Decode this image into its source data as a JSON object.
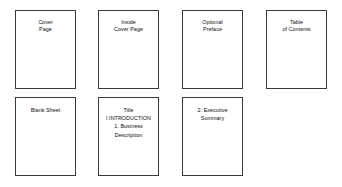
{
  "diagram": {
    "type": "document-structure-sequence",
    "pages": [
      {
        "id": "cover-page",
        "text": "Cover\nPage"
      },
      {
        "id": "inside-cover-page",
        "text": "Inside\nCover Page"
      },
      {
        "id": "optional-preface",
        "text": "Optional\nPreface"
      },
      {
        "id": "table-of-contents",
        "text": "Table\nof Contents"
      },
      {
        "id": "blank-sheet",
        "text": "Blank Sheet"
      },
      {
        "id": "title-introduction",
        "text": "Title\nI.INTRODUCTION\n1. Business\nDescription"
      },
      {
        "id": "executive-summary",
        "text": "2. Executive\nSummary"
      }
    ],
    "colors": {
      "border": "#3a3a3a",
      "background": "#ffffff",
      "text": "#0d0d0d"
    }
  }
}
